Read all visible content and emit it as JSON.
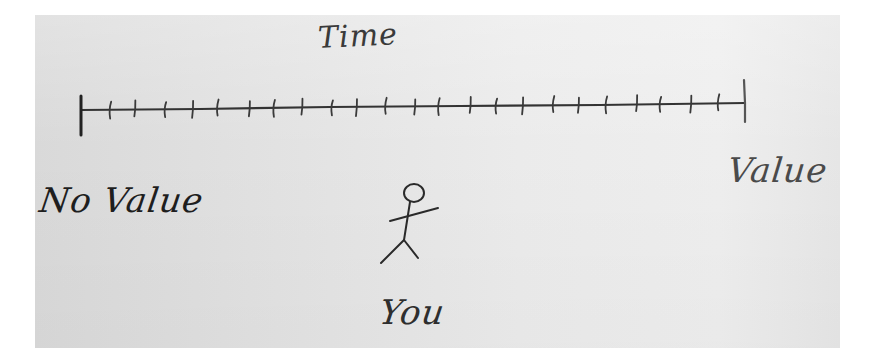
{
  "diagram": {
    "title": "Time",
    "axis": {
      "left_label": "No Value",
      "right_label": "Value",
      "tick_count": 23,
      "start_x": 81,
      "start_y": 110,
      "end_x": 745,
      "end_y": 103
    },
    "figure": {
      "label": "You",
      "icon": "stick-figure-icon"
    },
    "colors": {
      "ink": "#2a2a2a",
      "paper": "#e4e4e4",
      "background": "#ffffff"
    }
  }
}
